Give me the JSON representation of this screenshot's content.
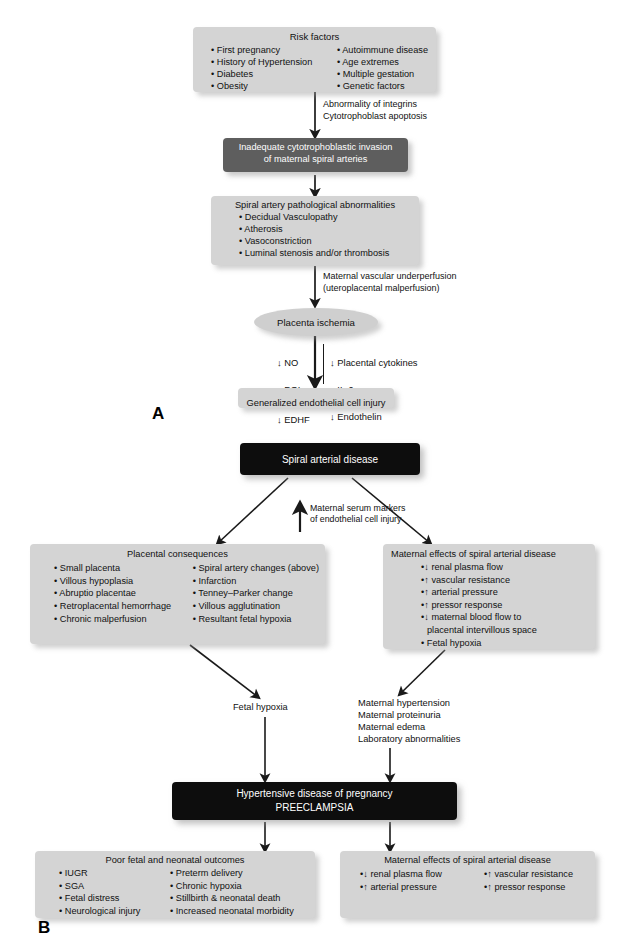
{
  "figure": {
    "panel_a_label": "A",
    "panel_b_label": "B"
  },
  "panel_a": {
    "risk_factors": {
      "title": "Risk factors",
      "col1": [
        "First pregnancy",
        "History of Hypertension",
        "Diabetes",
        "Obesity"
      ],
      "col2": [
        "Autoimmune disease",
        "Age extremes",
        "Multiple gestation",
        "Genetic factors"
      ]
    },
    "edge1_label": "Abnormality of integrins\nCytotrophoblast apoptosis",
    "inadequate_invasion": {
      "line1": "Inadequate cytotrophoblastic invasion",
      "line2": "of maternal spiral arteries"
    },
    "spiral_artery_abnormalities": {
      "title": "Spiral artery pathological abnormalities",
      "items": [
        "Decidual Vasculopathy",
        "Atherosis",
        "Vasoconstriction",
        "Luminal stenosis and/or thrombosis"
      ]
    },
    "edge2_label": "Maternal vascular underperfusion\n(uteroplacental malperfusion)",
    "placenta_ischemia": "Placenta ischemia",
    "mediators": {
      "col1": [
        {
          "arrow": "down",
          "label": "NO"
        },
        {
          "arrow": "down",
          "label": "PGI2",
          "subscript": "2",
          "base": "PGI"
        },
        {
          "arrow": "down",
          "label": "EDHF"
        }
      ],
      "col2": [
        {
          "arrow": "down",
          "label": "Placental cytokines"
        },
        {
          "arrow": "down",
          "label": "IL-6"
        },
        {
          "arrow": "down",
          "label": "Endothelin"
        }
      ]
    },
    "generalized_injury": "Generalized endothelial cell injury"
  },
  "panel_b": {
    "spiral_arterial_disease": "Spiral arterial disease",
    "serum_markers_label": "Maternal serum markers\nof endothelial cell injury",
    "serum_markers_arrow": "up",
    "placental_consequences": {
      "title": "Placental consequences",
      "col1": [
        "Small placenta",
        "Villous hypoplasia",
        "Abruptio placentae",
        "Retroplacental hemorrhage",
        "Chronic malperfusion"
      ],
      "col2": [
        "Spiral artery changes (above)",
        "Infarction",
        "Tenney–Parker change",
        "Villous agglutination",
        "Resultant fetal hypoxia"
      ]
    },
    "maternal_effects_upper": {
      "title": "Maternal effects of spiral arterial disease",
      "items": [
        {
          "arrow": "down",
          "text": "renal plasma flow"
        },
        {
          "arrow": "up",
          "text": "vascular resistance"
        },
        {
          "arrow": "up",
          "text": "arterial pressure"
        },
        {
          "arrow": "up",
          "text": "pressor response"
        },
        {
          "arrow": "down",
          "text": "maternal blood flow to"
        },
        {
          "arrow": "none",
          "text": "placental intervillous space"
        },
        {
          "arrow": "bullet",
          "text": "Fetal hypoxia"
        }
      ]
    },
    "fetal_hypoxia_label": "Fetal hypoxia",
    "maternal_findings_label": "Maternal hypertension\nMaternal proteinuria\nMaternal edema\nLaboratory abnormalities",
    "preeclampsia": {
      "line1": "Hypertensive disease of pregnancy",
      "line2": "PREECLAMPSIA"
    },
    "poor_outcomes": {
      "title": "Poor fetal and neonatal outcomes",
      "col1": [
        "IUGR",
        "SGA",
        "Fetal distress",
        "Neurological injury"
      ],
      "col2": [
        "Preterm delivery",
        "Chronic hypoxia",
        "Stillbirth & neonatal death",
        "Increased neonatal morbidity"
      ]
    },
    "maternal_effects_lower": {
      "title": "Maternal effects of spiral arterial disease",
      "col1": [
        {
          "arrow": "down",
          "text": "renal plasma flow"
        },
        {
          "arrow": "up",
          "text": "arterial pressure"
        }
      ],
      "col2": [
        {
          "arrow": "up",
          "text": "vascular resistance"
        },
        {
          "arrow": "up",
          "text": "pressor response"
        }
      ]
    }
  },
  "colors": {
    "box_grey": "#d4d4d4",
    "box_dark_grey": "#5e5e5e",
    "box_black": "#0d0d0d",
    "text_dark": "#111111",
    "text_light": "#ffffff",
    "arrow": "#1a1a1a"
  }
}
